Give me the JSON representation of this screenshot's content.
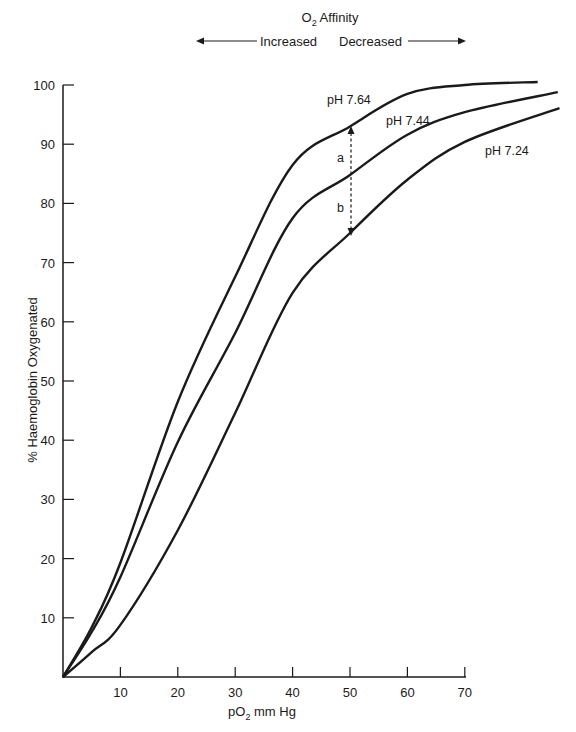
{
  "chart_data": {
    "type": "line",
    "title": "O2 Affinity",
    "header": {
      "title_main": "O",
      "title_sub": "2",
      "title_rest": " Affinity",
      "left_arrow_label": "Increased",
      "right_arrow_label": "Decreased"
    },
    "xlabel": "pO2 mm Hg",
    "xlabel_parts": {
      "main": "pO",
      "sub": "2",
      "rest": " mm Hg"
    },
    "ylabel": "% Haemoglobin Oxygenated",
    "xlim": [
      0,
      70
    ],
    "ylim": [
      0,
      100
    ],
    "x_ticks": [
      10,
      20,
      30,
      40,
      50,
      60,
      70
    ],
    "y_ticks": [
      10,
      20,
      30,
      40,
      50,
      60,
      70,
      80,
      90,
      100
    ],
    "grid": false,
    "legend": "inline labels on curves",
    "series": [
      {
        "name": "pH 7.64",
        "x": [
          0,
          5,
          10,
          20,
          30,
          40,
          50,
          60,
          70,
          82.7
        ],
        "values": [
          0,
          8.4,
          19.3,
          46.5,
          67.6,
          86.5,
          93,
          98.5,
          100,
          100.5
        ]
      },
      {
        "name": "pH 7.44",
        "x": [
          0,
          5,
          10,
          20,
          30,
          40,
          50,
          60,
          70,
          86.2
        ],
        "values": [
          0,
          7.6,
          16.9,
          39.7,
          58.1,
          77.5,
          84.8,
          91.6,
          95.4,
          98.8
        ]
      },
      {
        "name": "pH 7.24",
        "x": [
          0,
          5,
          10,
          20,
          30,
          40,
          50,
          60,
          70,
          86.5
        ],
        "values": [
          0,
          4.2,
          8.8,
          24.8,
          44.6,
          64.9,
          75,
          84,
          90.4,
          96.1
        ]
      }
    ],
    "annotations": [
      {
        "type": "double-arrow-dashed",
        "x": 50,
        "y_from": 75,
        "y_to": 93
      },
      {
        "label": "a",
        "x": 48.5,
        "y": 88.5
      },
      {
        "label": "b",
        "x": 48.5,
        "y": 79.5
      }
    ]
  }
}
